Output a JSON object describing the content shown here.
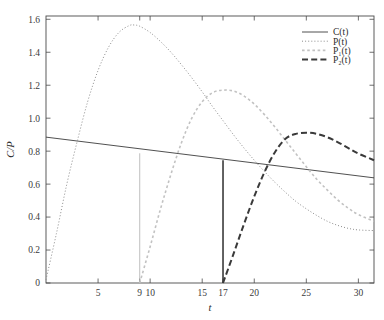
{
  "chart_data": {
    "type": "line",
    "title": "",
    "xlabel": "t",
    "ylabel": "C/P",
    "xlim": [
      0,
      31.5
    ],
    "ylim": [
      0,
      1.62
    ],
    "grid": false,
    "legend_position": "top-right",
    "xticks": [
      5,
      9,
      10,
      15,
      17,
      20,
      25,
      30
    ],
    "xtick_labels": [
      "5",
      "9",
      "10",
      "15",
      "17",
      "20",
      "25",
      "30"
    ],
    "yticks": [
      0,
      0.2,
      0.4,
      0.6,
      0.8,
      1.0,
      1.2,
      1.4,
      1.6
    ],
    "ytick_labels": [
      "0",
      "0.2",
      "0.4",
      "0.6",
      "0.8",
      "1.0",
      "1.2",
      "1.4",
      "1.6"
    ],
    "annotations": [
      {
        "name": "dropline-t9",
        "x": 9,
        "y_from": 0,
        "y_to": 0.787,
        "style": "thin-solid-gray"
      },
      {
        "name": "dropline-t17",
        "x": 17,
        "y_from": 0,
        "y_to": 0.745,
        "style": "thick-solid-dark"
      }
    ],
    "series": [
      {
        "name": "C(t)",
        "label": "C(t)",
        "style": "solid",
        "color": "#3c3c3c",
        "width": 0.9,
        "x": [
          0,
          31.5
        ],
        "values": [
          0.885,
          0.638
        ]
      },
      {
        "name": "P(t)",
        "label": "P(t)",
        "style": "dotted",
        "color": "#8c8c8c",
        "width": 1.0,
        "peak": {
          "x": 8.5,
          "y": 1.565
        },
        "x": [
          0,
          1,
          2,
          3,
          4,
          5,
          6,
          7,
          8,
          8.5,
          9,
          10,
          11,
          12,
          13,
          14,
          15,
          16,
          17,
          18,
          19,
          20,
          21,
          22,
          23,
          24,
          25,
          26,
          27,
          28,
          29,
          30,
          31.5
        ],
        "values": [
          0.02,
          0.3,
          0.6,
          0.86,
          1.1,
          1.29,
          1.43,
          1.52,
          1.562,
          1.565,
          1.558,
          1.52,
          1.465,
          1.4,
          1.325,
          1.245,
          1.16,
          1.07,
          0.985,
          0.9,
          0.82,
          0.745,
          0.675,
          0.61,
          0.55,
          0.495,
          0.45,
          0.41,
          0.375,
          0.35,
          0.332,
          0.322,
          0.318
        ]
      },
      {
        "name": "P1(t)",
        "label": "P₁(t)",
        "style": "dashed-light",
        "color": "#c2c2c2",
        "width": 1.6,
        "start_x": 9,
        "peak": {
          "x": 17,
          "y": 1.17
        },
        "x": [
          9,
          10,
          11,
          12,
          13,
          14,
          15,
          16,
          17,
          18,
          19,
          20,
          21,
          22,
          23,
          24,
          25,
          26,
          27,
          28,
          29,
          30,
          31.5
        ],
        "values": [
          0.0,
          0.22,
          0.45,
          0.66,
          0.85,
          1.0,
          1.1,
          1.155,
          1.17,
          1.165,
          1.135,
          1.085,
          1.02,
          0.945,
          0.865,
          0.785,
          0.705,
          0.63,
          0.565,
          0.505,
          0.455,
          0.415,
          0.375
        ]
      },
      {
        "name": "P2(t)",
        "label": "P₂(t)",
        "style": "dashed-bold",
        "color": "#3a3a3a",
        "width": 2.0,
        "start_x": 17,
        "peak": {
          "x": 25,
          "y": 0.91
        },
        "x": [
          17,
          18,
          19,
          20,
          21,
          22,
          23,
          24,
          25,
          26,
          27,
          28,
          29,
          30,
          31.5
        ],
        "values": [
          0.0,
          0.175,
          0.355,
          0.525,
          0.675,
          0.795,
          0.875,
          0.905,
          0.912,
          0.905,
          0.885,
          0.855,
          0.82,
          0.785,
          0.745
        ]
      }
    ],
    "legend_entries": [
      {
        "label": "C(t)",
        "style": "solid",
        "color": "#3c3c3c"
      },
      {
        "label": "P(t)",
        "style": "dotted",
        "color": "#8c8c8c"
      },
      {
        "label": "P₁(t)",
        "style": "dashed-light",
        "color": "#c2c2c2"
      },
      {
        "label": "P₂(t)",
        "style": "dashed-bold",
        "color": "#3a3a3a"
      }
    ]
  }
}
